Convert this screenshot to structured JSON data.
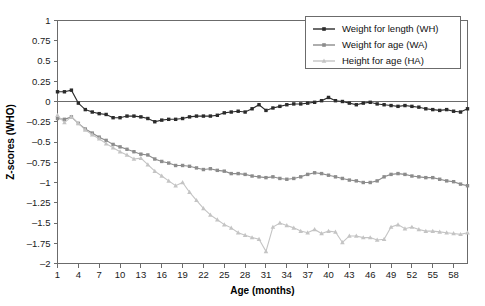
{
  "chart_data": {
    "type": "line",
    "title": "",
    "xlabel": "Age (months)",
    "ylabel": "Z-scores (WHO)",
    "xlim": [
      1,
      60
    ],
    "ylim": [
      -2,
      1
    ],
    "grid": false,
    "legend_position": "top-right",
    "y_ticks": [
      1,
      0.75,
      0.5,
      0.25,
      0,
      -0.25,
      -0.5,
      -0.75,
      -1,
      -1.25,
      -1.5,
      -1.75,
      -2
    ],
    "y_tick_labels": [
      "1",
      "0.75",
      "0.5",
      "0.25",
      "0",
      "-0.25",
      "-0.5",
      "-0.75",
      "-1",
      "-1.25",
      "-1.5",
      "-1.75",
      "-2"
    ],
    "x_ticks": [
      1,
      4,
      7,
      10,
      13,
      16,
      19,
      22,
      25,
      28,
      31,
      34,
      37,
      40,
      43,
      46,
      49,
      52,
      55,
      58
    ],
    "x_tick_labels": [
      "1",
      "4",
      "7",
      "10",
      "13",
      "16",
      "19",
      "22",
      "25",
      "28",
      "31",
      "34",
      "37",
      "40",
      "43",
      "46",
      "49",
      "52",
      "55",
      "58"
    ],
    "x": [
      1,
      2,
      3,
      4,
      5,
      6,
      7,
      8,
      9,
      10,
      11,
      12,
      13,
      14,
      15,
      16,
      17,
      18,
      19,
      20,
      21,
      22,
      23,
      24,
      25,
      26,
      27,
      28,
      29,
      30,
      31,
      32,
      33,
      34,
      35,
      36,
      37,
      38,
      39,
      40,
      41,
      42,
      43,
      44,
      45,
      46,
      47,
      48,
      49,
      50,
      51,
      52,
      53,
      54,
      55,
      56,
      57,
      58,
      59,
      60
    ],
    "series": [
      {
        "name": "Weight for length (WH)",
        "color": "#2b2b2b",
        "marker": "square",
        "values": [
          0.12,
          0.12,
          0.14,
          -0.02,
          -0.1,
          -0.13,
          -0.15,
          -0.16,
          -0.2,
          -0.2,
          -0.18,
          -0.18,
          -0.19,
          -0.21,
          -0.25,
          -0.23,
          -0.22,
          -0.22,
          -0.21,
          -0.19,
          -0.18,
          -0.18,
          -0.18,
          -0.17,
          -0.14,
          -0.13,
          -0.12,
          -0.13,
          -0.09,
          -0.04,
          -0.11,
          -0.08,
          -0.06,
          -0.04,
          -0.03,
          -0.03,
          -0.02,
          -0.01,
          0.01,
          0.05,
          0.01,
          0.0,
          -0.02,
          -0.04,
          -0.02,
          -0.01,
          -0.03,
          -0.04,
          -0.05,
          -0.06,
          -0.05,
          -0.06,
          -0.07,
          -0.09,
          -0.1,
          -0.11,
          -0.1,
          -0.12,
          -0.13,
          -0.09
        ]
      },
      {
        "name": "Weight for age (WA)",
        "color": "#8c8c8c",
        "marker": "square",
        "values": [
          -0.21,
          -0.22,
          -0.19,
          -0.27,
          -0.34,
          -0.39,
          -0.44,
          -0.48,
          -0.53,
          -0.56,
          -0.59,
          -0.62,
          -0.65,
          -0.66,
          -0.71,
          -0.74,
          -0.76,
          -0.79,
          -0.79,
          -0.8,
          -0.82,
          -0.84,
          -0.83,
          -0.85,
          -0.86,
          -0.89,
          -0.89,
          -0.9,
          -0.92,
          -0.93,
          -0.94,
          -0.93,
          -0.95,
          -0.96,
          -0.95,
          -0.93,
          -0.9,
          -0.88,
          -0.89,
          -0.91,
          -0.93,
          -0.95,
          -0.97,
          -0.98,
          -1.0,
          -1.0,
          -0.98,
          -0.93,
          -0.9,
          -0.89,
          -0.9,
          -0.92,
          -0.93,
          -0.94,
          -0.94,
          -0.96,
          -0.98,
          -0.99,
          -1.02,
          -1.04
        ]
      },
      {
        "name": "Height for age (HA)",
        "color": "#c4c4c4",
        "marker": "triangle",
        "values": [
          -0.17,
          -0.26,
          -0.19,
          -0.27,
          -0.35,
          -0.41,
          -0.46,
          -0.52,
          -0.57,
          -0.62,
          -0.66,
          -0.71,
          -0.7,
          -0.78,
          -0.86,
          -0.92,
          -0.98,
          -1.04,
          -1.0,
          -1.12,
          -1.22,
          -1.32,
          -1.4,
          -1.46,
          -1.52,
          -1.56,
          -1.62,
          -1.65,
          -1.68,
          -1.7,
          -1.85,
          -1.55,
          -1.5,
          -1.53,
          -1.56,
          -1.6,
          -1.62,
          -1.58,
          -1.63,
          -1.6,
          -1.61,
          -1.74,
          -1.66,
          -1.66,
          -1.68,
          -1.68,
          -1.71,
          -1.7,
          -1.55,
          -1.52,
          -1.57,
          -1.55,
          -1.58,
          -1.6,
          -1.6,
          -1.61,
          -1.62,
          -1.63,
          -1.64,
          -1.62
        ]
      }
    ]
  },
  "legend": {
    "items": [
      {
        "label": "Weight for length (WH)"
      },
      {
        "label": "Weight for age (WA)"
      },
      {
        "label": "Height for age (HA)"
      }
    ]
  }
}
